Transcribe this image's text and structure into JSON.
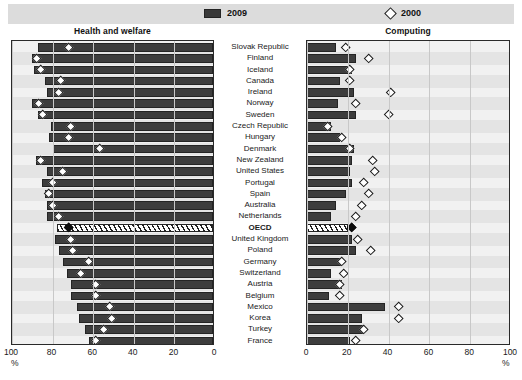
{
  "legend": {
    "items": [
      {
        "label": "2009",
        "icon": "bar-swatch-icon",
        "color": "#3a3a3a"
      },
      {
        "label": "2000",
        "icon": "diamond-swatch-icon",
        "color": "#ffffff"
      }
    ]
  },
  "panels": {
    "left": {
      "title": "Health and welfare",
      "unit": "%"
    },
    "right": {
      "title": "Computing",
      "unit": "%"
    }
  },
  "axis": {
    "left_ticks": [
      "100",
      "80",
      "60",
      "40",
      "20",
      "0"
    ],
    "right_ticks": [
      "0",
      "20",
      "40",
      "60",
      "80",
      "100"
    ]
  },
  "countries": [
    "Slovak Republic",
    "Finland",
    "Iceland",
    "Canada",
    "Ireland",
    "Norway",
    "Sweden",
    "Czech Republic",
    "Hungary",
    "Denmark",
    "New Zealand",
    "United States",
    "Portugal",
    "Spain",
    "Australia",
    "Netherlands",
    "OECD",
    "United Kingdom",
    "Poland",
    "Germany",
    "Switzerland",
    "Austria",
    "Belgium",
    "Mexico",
    "Korea",
    "Turkey",
    "France"
  ],
  "chart_data": {
    "type": "bar",
    "xlabel": "%",
    "ylabel": "",
    "grid": true,
    "legend_position": "top",
    "panels": [
      {
        "name": "Health and welfare",
        "xlim": [
          100,
          0
        ],
        "reversed": true,
        "categories": [
          "Slovak Republic",
          "Finland",
          "Iceland",
          "Canada",
          "Ireland",
          "Norway",
          "Sweden",
          "Czech Republic",
          "Hungary",
          "Denmark",
          "New Zealand",
          "United States",
          "Portugal",
          "Spain",
          "Australia",
          "Netherlands",
          "OECD",
          "United Kingdom",
          "Poland",
          "Germany",
          "Switzerland",
          "Austria",
          "Belgium",
          "Mexico",
          "Korea",
          "Turkey",
          "France"
        ],
        "series": [
          {
            "name": "2009",
            "values": [
              86,
              89,
              88,
              83,
              82,
              89,
              86,
              80,
              81,
              79,
              87,
              82,
              84,
              83,
              82,
              82,
              77,
              78,
              76,
              74,
              72,
              70,
              70,
              67,
              66,
              63,
              61
            ]
          },
          {
            "name": "2000",
            "values": [
              72,
              88,
              86,
              76,
              77,
              87,
              85,
              71,
              72,
              57,
              86,
              75,
              80,
              82,
              80,
              77,
              72,
              71,
              70,
              62,
              66,
              59,
              59,
              52,
              51,
              55,
              59
            ]
          }
        ]
      },
      {
        "name": "Computing",
        "xlim": [
          0,
          100
        ],
        "reversed": false,
        "categories": [
          "Slovak Republic",
          "Finland",
          "Iceland",
          "Canada",
          "Ireland",
          "Norway",
          "Sweden",
          "Czech Republic",
          "Hungary",
          "Denmark",
          "New Zealand",
          "United States",
          "Portugal",
          "Spain",
          "Australia",
          "Netherlands",
          "OECD",
          "United Kingdom",
          "Poland",
          "Germany",
          "Switzerland",
          "Austria",
          "Belgium",
          "Mexico",
          "Korea",
          "Turkey",
          "France"
        ],
        "series": [
          {
            "name": "2009",
            "values": [
              14,
              24,
              22,
              16,
              23,
              15,
              24,
              12,
              16,
              23,
              22,
              21,
              22,
              19,
              14,
              12,
              20,
              22,
              24,
              17,
              12,
              17,
              11,
              38,
              27,
              28,
              21
            ]
          },
          {
            "name": "2000",
            "values": [
              19,
              30,
              21,
              21,
              41,
              24,
              40,
              10,
              17,
              21,
              32,
              33,
              28,
              30,
              27,
              24,
              22,
              25,
              31,
              17,
              18,
              16,
              16,
              45,
              45,
              28,
              24
            ]
          }
        ]
      }
    ]
  }
}
